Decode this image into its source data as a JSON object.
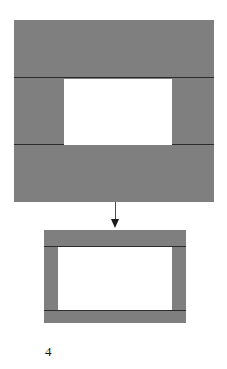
{
  "figure": {
    "caption": "4",
    "palette": {
      "fill_gray": "#7f7f80",
      "outline_dark": "#2b2b2b",
      "window_white": "#ffffff",
      "background": "#ffffff",
      "arrow_shaft": "#4a4a4a",
      "arrow_head": "#1a1a1a",
      "caption_text": "#151515"
    },
    "top_shape": {
      "name": "large-frame-blank",
      "bands": [
        {
          "label": "upper-band"
        },
        {
          "label": "middle-band"
        },
        {
          "label": "lower-band"
        }
      ],
      "aperture": {
        "label": "window-opening"
      }
    },
    "arrow": {
      "label": "process-arrow",
      "direction": "down"
    },
    "bottom_shape": {
      "name": "finished-frame",
      "aperture": {
        "label": "window-opening"
      },
      "posts": [
        {
          "label": "left-stile"
        },
        {
          "label": "right-stile"
        }
      ],
      "rails": [
        {
          "label": "top-rail"
        },
        {
          "label": "bottom-rail"
        }
      ]
    }
  }
}
